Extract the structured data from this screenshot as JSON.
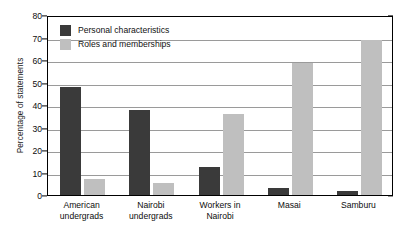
{
  "chart_data": {
    "type": "bar",
    "title": "",
    "xlabel": "",
    "ylabel": "Percentage of statements",
    "ylim": [
      0,
      80
    ],
    "yticks": [
      0,
      10,
      20,
      30,
      40,
      50,
      60,
      70,
      80
    ],
    "ytick_labels": [
      "0",
      "10",
      "20",
      "30",
      "40",
      "50",
      "60",
      "70",
      "80"
    ],
    "grid": true,
    "legend_position": "upper-left-inside",
    "categories": [
      "American undergrads",
      "Nairobi undergrads",
      "Workers in Nairobi",
      "Masai",
      "Samburu"
    ],
    "category_lines": [
      [
        "American",
        "undergrads"
      ],
      [
        "Nairobi",
        "undergrads"
      ],
      [
        "Workers in",
        "Nairobi"
      ],
      [
        "Masai",
        ""
      ],
      [
        "Samburu",
        ""
      ]
    ],
    "series": [
      {
        "name": "Personal characteristics",
        "color": "#3a3a3a",
        "values": [
          48,
          38,
          12.5,
          3,
          2
        ]
      },
      {
        "name": "Roles and memberships",
        "color": "#bfbfbf",
        "values": [
          7,
          5.5,
          36,
          58.5,
          69
        ]
      }
    ]
  },
  "colors": {
    "axis": "#000000",
    "grid": "#9a9a9a",
    "background": "#ffffff",
    "text": "#0d0d0d"
  }
}
